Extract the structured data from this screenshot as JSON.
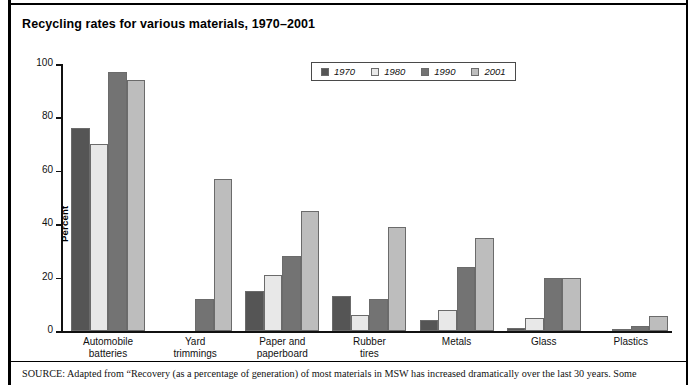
{
  "chart_data": {
    "type": "bar",
    "title": "Recycling rates for various materials, 1970–2001",
    "xlabel": "",
    "ylabel": "Percent",
    "ylim": [
      0,
      100
    ],
    "yticks": [
      0,
      20,
      40,
      60,
      80,
      100
    ],
    "grid": false,
    "legend_position": "top-center",
    "categories": [
      "Automobile batteries",
      "Yard trimmings",
      "Paper and paperboard",
      "Rubber tires",
      "Metals",
      "Glass",
      "Plastics"
    ],
    "category_lines": [
      [
        "Automobile",
        "batteries"
      ],
      [
        "Yard",
        "trimmings"
      ],
      [
        "Paper and",
        "paperboard"
      ],
      [
        "Rubber",
        "tires"
      ],
      [
        "Metals"
      ],
      [
        "Glass"
      ],
      [
        "Plastics"
      ]
    ],
    "series": [
      {
        "name": "1970",
        "color": "#555555",
        "values": [
          76,
          0,
          15,
          13,
          4,
          1,
          0
        ]
      },
      {
        "name": "1980",
        "color": "#e8e8e8",
        "values": [
          70,
          0,
          21,
          6,
          8,
          5,
          0.5
        ]
      },
      {
        "name": "1990",
        "color": "#737373",
        "values": [
          97,
          12,
          28,
          12,
          24,
          20,
          2
        ]
      },
      {
        "name": "2001",
        "color": "#bdbdbd",
        "values": [
          94,
          57,
          45,
          39,
          35,
          20,
          5.5
        ]
      }
    ]
  },
  "legend": {
    "items": [
      {
        "label": "1970",
        "color": "#555555"
      },
      {
        "label": "1980",
        "color": "#e8e8e8"
      },
      {
        "label": "1990",
        "color": "#737373"
      },
      {
        "label": "2001",
        "color": "#bdbdbd"
      }
    ]
  },
  "source": {
    "kicker": "SOURCE:",
    "text": " Adapted from “Recovery (as a percentage of generation) of most materials in MSW has increased dramatically over the last 30 years. Some"
  }
}
